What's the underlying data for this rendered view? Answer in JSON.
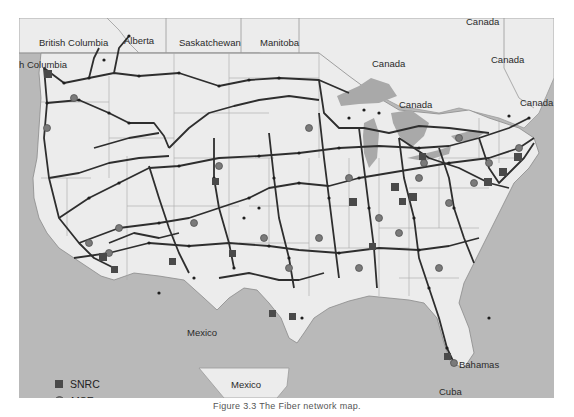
{
  "map": {
    "regions": {
      "canada_provinces": [
        "British Columbia",
        "Alberta",
        "Saskatchewan",
        "Manitoba"
      ],
      "canada_labels": [
        "Canada",
        "Canada",
        "Canada",
        "Canada",
        "Canada"
      ],
      "bc_fragment": "h Columbia",
      "mexico_labels": [
        "Mexico",
        "Mexico"
      ],
      "caribbean_labels": [
        "Bahamas",
        "Cuba"
      ]
    },
    "colors": {
      "water": "#b9b9b9",
      "land": "#ececec",
      "lakes": "#a9a9a9",
      "borders": "#9a9a9a",
      "routes": "#2e2e2e",
      "snrc": "#4a4a4a",
      "mse": "#7a7a7a"
    }
  },
  "legend": {
    "items": [
      {
        "symbol": "square",
        "label": "SNRC"
      },
      {
        "symbol": "circle",
        "label": "MSE"
      }
    ]
  },
  "caption": "Figure 3.3 The Fiber network map."
}
